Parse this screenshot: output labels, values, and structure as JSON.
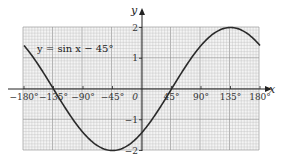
{
  "chart_data": {
    "type": "line",
    "title": "",
    "annotation": "y = sin x − 45°",
    "xlabel": "x",
    "ylabel": "y",
    "xlim": [
      -180,
      180
    ],
    "ylim": [
      -2,
      2
    ],
    "grid": true,
    "x_ticks": [
      -180,
      -135,
      -90,
      -45,
      0,
      45,
      90,
      135,
      180
    ],
    "x_tick_labels": [
      "−180°",
      "−135°",
      "−90°",
      "−45°",
      "0",
      "45°",
      "90°",
      "135°",
      "180°"
    ],
    "y_ticks": [
      -2,
      -1,
      1,
      2
    ],
    "y_tick_labels": [
      "−2",
      "−1",
      "1",
      "2"
    ],
    "series": [
      {
        "name": "y = sin x − 45°",
        "function": "2*sin(x - 45°)",
        "x": [
          -180,
          -135,
          -90,
          -45,
          0,
          45,
          90,
          135,
          180
        ],
        "values": [
          1.41,
          0,
          -1.41,
          -2,
          -1.41,
          0,
          1.41,
          2,
          1.41
        ]
      }
    ]
  },
  "layout": {
    "plot_left": 23,
    "plot_right": 259,
    "plot_top": 27,
    "plot_bottom": 150,
    "origin_x": 142,
    "origin_y": 89,
    "grid_color": "#b8b8b8",
    "grid_major_color": "#8a8a8a",
    "curve_color": "#2a2a2a",
    "axis_color": "#222222"
  }
}
